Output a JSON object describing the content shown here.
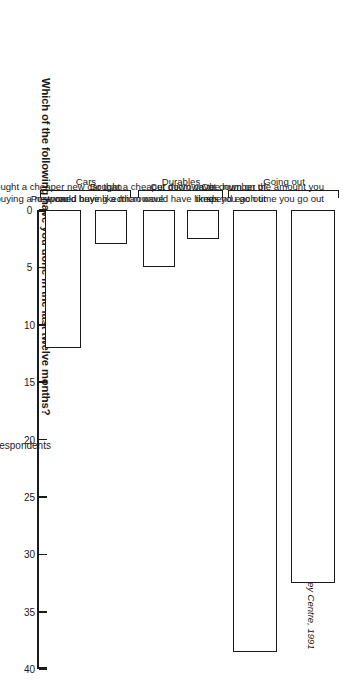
{
  "chart_data": {
    "type": "bar",
    "orientation": "vertical-rotated",
    "title": "Which of the following have you done in the last twelve months?",
    "xlabel": "",
    "ylabel": "% of respondents",
    "ylim": [
      0,
      40
    ],
    "ytick_labels": [
      "0",
      "5",
      "10",
      "15",
      "20",
      "25",
      "30",
      "35",
      "40"
    ],
    "ytick_values": [
      0,
      5,
      10,
      15,
      20,
      25,
      30,
      35,
      40
    ],
    "grid": false,
    "legend": "none",
    "categories": [
      "Cut down on the amount you spend each time you go out",
      "Cut down on the number of times you go out",
      "Bought a cheaper microwave than would have liked",
      "Postponed buying a microwave",
      "Bought a cheaper new car than would have liked",
      "Postponed buying a new car"
    ],
    "values": [
      32.5,
      38.5,
      2.5,
      5,
      3,
      12
    ],
    "bars": [
      {
        "label_line1": "Cut down on the amount you",
        "label_line2": "spend each time you go out",
        "value": 32.5
      },
      {
        "label_line1": "Cut down on the number of",
        "label_line2": "times you go out",
        "value": 38.5
      },
      {
        "label_line1": "Bought a cheaper microwave",
        "label_line2": "than would have liked",
        "value": 2.5
      },
      {
        "label_line1": "Postponed buying a microwave",
        "label_line2": "",
        "value": 5
      },
      {
        "label_line1": "Bought a cheaper new car than",
        "label_line2": "would have liked",
        "value": 3
      },
      {
        "label_line1": "Postponed buying a new car",
        "label_line2": "",
        "value": 12
      }
    ],
    "groups": [
      {
        "label": "Going out",
        "members": [
          0,
          1
        ]
      },
      {
        "label": "Durables",
        "members": [
          2,
          3
        ]
      },
      {
        "label": "Cars",
        "members": [
          4,
          5
        ]
      }
    ],
    "annotations": {
      "source": "Source: Henley Centre, 1991"
    },
    "colors": {
      "bar_fill": "#ffffff",
      "bar_stroke": "#1a1a1a",
      "axis": "#1a1a1a",
      "text": "#1a1a1a",
      "background": "#ffffff"
    }
  },
  "chart": {
    "title": "Which of the following have you done in the last twelve months?",
    "value_axis_title": "% of respondents",
    "source": "Source: Henley Centre, 1991",
    "ticks": [
      {
        "label": "0"
      },
      {
        "label": "5"
      },
      {
        "label": "10"
      },
      {
        "label": "15"
      },
      {
        "label": "20"
      },
      {
        "label": "25"
      },
      {
        "label": "30"
      },
      {
        "label": "35"
      },
      {
        "label": "40"
      }
    ],
    "bars": [
      {
        "line1": "Cut down on the amount you",
        "line2": "spend each time you go out"
      },
      {
        "line1": "Cut down on the number of",
        "line2": "times you go out"
      },
      {
        "line1": "Bought a cheaper microwave",
        "line2": "than would have liked"
      },
      {
        "line1": "Postponed buying a microwave",
        "line2": ""
      },
      {
        "line1": "Bought a cheaper new car than",
        "line2": "would have liked"
      },
      {
        "line1": "Postponed buying a new car",
        "line2": ""
      }
    ],
    "groups": [
      {
        "label": "Going out"
      },
      {
        "label": "Durables"
      },
      {
        "label": "Cars"
      }
    ]
  }
}
